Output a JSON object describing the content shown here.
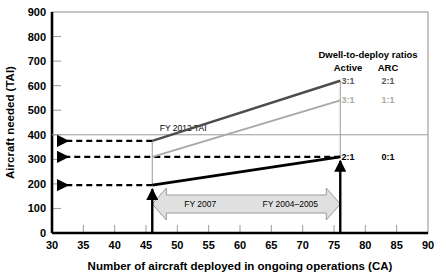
{
  "chart_data": {
    "type": "line",
    "title": "",
    "xlabel": "Number of aircraft deployed in ongoing operations (CA)",
    "ylabel": "Aircraft needed (TAI)",
    "xlim": [
      30,
      90
    ],
    "ylim": [
      0,
      900
    ],
    "xticks": [
      30,
      35,
      40,
      45,
      50,
      55,
      60,
      65,
      70,
      75,
      80,
      85,
      90
    ],
    "yticks": [
      0,
      100,
      200,
      300,
      400,
      500,
      600,
      700,
      800,
      900
    ],
    "grid": false,
    "legend_position": "upper-right-inside",
    "legend_title": "Dwell-to-deploy ratios",
    "legend_col_headers": [
      "Active",
      "ARC"
    ],
    "series": [
      {
        "name": "3:1 Active / 2:1 ARC",
        "active": "3:1",
        "arc": "2:1",
        "color": "#4d4d4d",
        "x": [
          46,
          76
        ],
        "values": [
          375,
          620
        ]
      },
      {
        "name": "3:1 Active / 1:1 ARC",
        "active": "3:1",
        "arc": "1:1",
        "color": "#a8a8a8",
        "x": [
          46,
          76
        ],
        "values": [
          310,
          540
        ]
      },
      {
        "name": "2:1 Active / 0:1 ARC",
        "active": "2:1",
        "arc": "0:1",
        "color": "#000000",
        "x": [
          46,
          76
        ],
        "values": [
          195,
          310
        ]
      }
    ],
    "reference_lines": [
      {
        "name": "FY 2012 TAI",
        "label": "FY 2012 TAI",
        "orientation": "horizontal",
        "y": 400,
        "color": "#9a9a9a"
      }
    ],
    "markers": [
      {
        "name": "CA 46 marker",
        "x": 46,
        "label": "FY 2007"
      },
      {
        "name": "CA 76 marker",
        "x": 76,
        "label": "FY 2004–2005"
      }
    ],
    "callout_arrows": [
      {
        "name": "dashed-arrow-375",
        "y": 375,
        "from_x": 46,
        "to_axis": true
      },
      {
        "name": "dashed-arrow-310",
        "y": 310,
        "from_x": 76,
        "to_axis": true
      },
      {
        "name": "dashed-arrow-195",
        "y": 195,
        "from_x": 46,
        "to_axis": true
      }
    ],
    "band": {
      "name": "fiscal-year-band",
      "left_label": "FY 2007",
      "right_label": "FY 2004–2005",
      "x_start": 46,
      "x_end": 76,
      "fill": "#e0e0e0",
      "stroke": "#9a9a9a"
    }
  },
  "axes": {
    "y_title": "Aircraft needed (TAI)",
    "x_title": "Number of aircraft deployed in ongoing operations (CA)",
    "y_labels": [
      "900",
      "800",
      "700",
      "600",
      "500",
      "400",
      "300",
      "200",
      "100",
      "0"
    ],
    "x_labels": [
      "30",
      "35",
      "40",
      "45",
      "50",
      "55",
      "60",
      "65",
      "70",
      "75",
      "80",
      "85",
      "90"
    ]
  },
  "legend": {
    "title": "Dwell-to-deploy ratios",
    "header_active": "Active",
    "header_arc": "ARC",
    "rows": [
      {
        "active": "3:1",
        "arc": "2:1"
      },
      {
        "active": "3:1",
        "arc": "1:1"
      },
      {
        "active": "2:1",
        "arc": "0:1"
      }
    ]
  },
  "annotations": {
    "fy2012": "FY 2012 TAI",
    "fy2007": "FY 2007",
    "fy2004_2005": "FY 2004–2005"
  }
}
